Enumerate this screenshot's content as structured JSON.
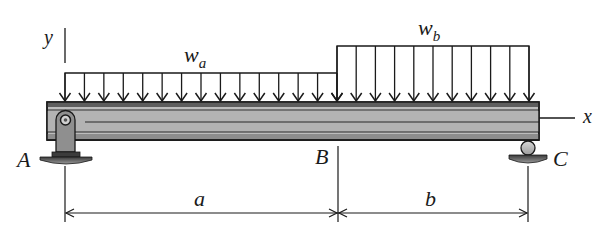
{
  "diagram": {
    "type": "simply-supported beam with two uniform distributed loads",
    "axes": {
      "y_label": "y",
      "x_label": "x"
    },
    "loads": [
      {
        "name": "w",
        "subscript": "a",
        "span": "A to B",
        "arrow_count": 15
      },
      {
        "name": "w",
        "subscript": "b",
        "span": "B to C",
        "arrow_count": 11
      }
    ],
    "supports": [
      {
        "label": "A",
        "type": "pin"
      },
      {
        "label": "C",
        "type": "roller"
      }
    ],
    "points": {
      "A": "A",
      "B": "B",
      "C": "C"
    },
    "dimensions": [
      {
        "label": "a",
        "from": "A",
        "to": "B"
      },
      {
        "label": "b",
        "from": "B",
        "to": "C"
      }
    ],
    "colors": {
      "line": "#1a1a1a",
      "beam_fill": "#b8b8b8",
      "beam_flange": "#6e6e6e",
      "support_fill": "#8a8a8a",
      "ground_fill": "#555555"
    }
  }
}
